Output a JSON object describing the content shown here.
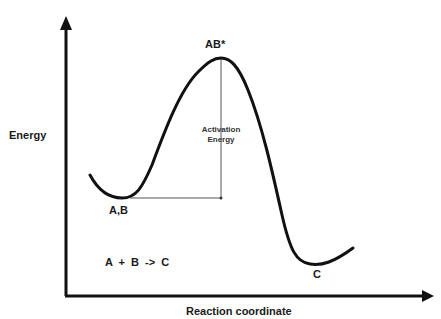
{
  "diagram": {
    "type": "reaction-energy-profile",
    "axes": {
      "y_label": "Energy",
      "x_label": "Reaction coordinate"
    },
    "points": {
      "reactants": "A,B",
      "transition_state": "AB*",
      "product": "C"
    },
    "annotation": {
      "activation_line1": "Activation",
      "activation_line2": "Energy"
    },
    "equation": "A + B -> C",
    "colors": {
      "curve": "#111111",
      "axes": "#111111",
      "guide_lines": "#555555"
    }
  }
}
